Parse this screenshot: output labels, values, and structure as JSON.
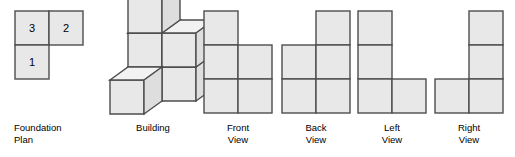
{
  "figure": {
    "background_color": "#ffffff",
    "face_fill": "#e8e8e8",
    "top_face_fill": "#f2f2f2",
    "side_face_fill": "#dedede",
    "stroke_color": "#4d4d4d",
    "text_color": "#000000",
    "cell_size": 34
  },
  "foundation_plan": {
    "caption": "Foundation\nPlan",
    "grid": [
      [
        {
          "label": "3",
          "filled": true
        },
        {
          "label": "2",
          "filled": true
        }
      ],
      [
        {
          "label": "1",
          "filled": true
        },
        {
          "label": "",
          "filled": false
        }
      ]
    ],
    "values": [
      3,
      2,
      1
    ]
  },
  "building": {
    "caption": "Building",
    "description": "isometric stack of cubes",
    "cube_count": 6
  },
  "views": [
    {
      "id": "front-view",
      "caption": "Front\nView",
      "grid": [
        [
          true,
          false
        ],
        [
          true,
          true
        ],
        [
          true,
          true
        ]
      ]
    },
    {
      "id": "back-view",
      "caption": "Back\nView",
      "grid": [
        [
          false,
          true
        ],
        [
          true,
          true
        ],
        [
          true,
          true
        ]
      ]
    },
    {
      "id": "left-view",
      "caption": "Left\nView",
      "grid": [
        [
          true,
          false
        ],
        [
          true,
          false
        ],
        [
          true,
          true
        ]
      ]
    },
    {
      "id": "right-view",
      "caption": "Right\nView",
      "grid": [
        [
          false,
          true
        ],
        [
          false,
          true
        ],
        [
          true,
          true
        ]
      ]
    }
  ]
}
